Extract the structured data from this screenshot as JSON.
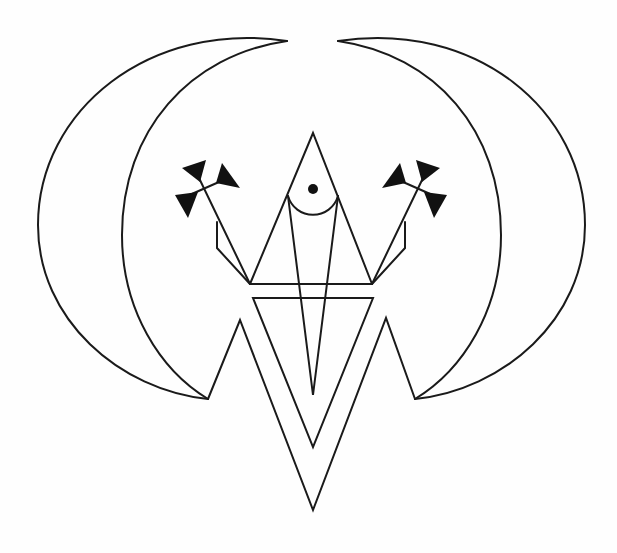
{
  "figure": {
    "description": "Black line-art sigil: two mirrored crescents framing a central composition of triangles, a circle with dot, and two arrow-like crosses",
    "colors": {
      "background": "#fefefe",
      "line": "#1a1a1a",
      "fill": "#111111"
    },
    "elements": [
      "left-crescent",
      "right-crescent",
      "zigzag-w",
      "inverted-triangle",
      "central-triangle",
      "horizontal-bar",
      "semicircle",
      "center-dot",
      "center-spike",
      "left-arrow-cross",
      "right-arrow-cross"
    ]
  }
}
